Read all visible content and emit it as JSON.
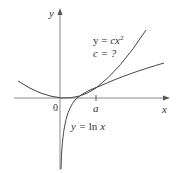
{
  "diagram": {
    "axes": {
      "x_label": "x",
      "y_label": "y",
      "origin_label": "0",
      "tick_label": "a"
    },
    "curves": [
      {
        "name": "parabola",
        "equation_prefix": "y = ",
        "equation_var": "cx",
        "equation_exp": "2"
      },
      {
        "name": "logarithm",
        "equation": "y = ln x"
      }
    ],
    "annotations": {
      "parabola_label_line1_prefix": "y = ",
      "parabola_label_line1_var": "cx",
      "parabola_label_line1_exp": "2",
      "parabola_label_line2": "c = ?",
      "log_label_prefix": "y = ",
      "log_label_fn": "ln ",
      "log_label_var": "x"
    },
    "colors": {
      "axis": "#777777",
      "curve": "#444444",
      "text": "#333333"
    }
  }
}
